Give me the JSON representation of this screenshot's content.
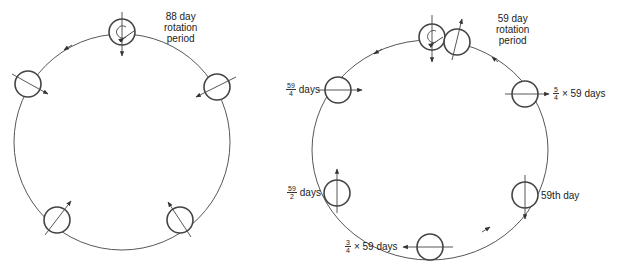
{
  "left_diagram": {
    "title": "88 day rotation period",
    "title_lines": [
      "88 day",
      "rotation",
      "period"
    ],
    "orbit_direction": "counterclockwise"
  },
  "right_diagram": {
    "title": "59 day rotation period",
    "title_lines": [
      "59 day",
      "rotation",
      "period"
    ],
    "orbit_direction": "counterclockwise",
    "labels": {
      "left_top": {
        "num": "59",
        "den": "4",
        "suffix": "days"
      },
      "left_bottom": {
        "num": "59",
        "den": "2",
        "suffix": "days"
      },
      "bottom": {
        "num": "3",
        "den": "4",
        "suffix": "× 59 days"
      },
      "right_bottom": {
        "text": "59th day"
      },
      "right_top": {
        "num": "5",
        "den": "4",
        "suffix": "× 59 days"
      }
    }
  },
  "colors": {
    "line": "#333333",
    "background": "#ffffff"
  }
}
